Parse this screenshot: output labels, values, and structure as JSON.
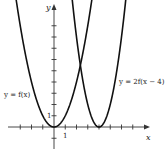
{
  "chart_data": {
    "type": "line",
    "title": "",
    "xlabel": "x",
    "ylabel": "y",
    "xlim": [
      -4,
      8
    ],
    "ylim": [
      -1,
      11
    ],
    "x_tick_step": 1,
    "y_tick_step": 1,
    "x_ticks": [
      -3,
      -2,
      -1,
      1,
      2,
      3,
      4,
      5,
      6,
      7
    ],
    "y_ticks": [
      -1,
      1,
      2,
      3,
      4,
      5,
      6,
      7,
      8,
      9
    ],
    "x_tick_labels": [
      {
        "value": 1,
        "text": "1"
      }
    ],
    "y_tick_labels": [
      {
        "value": 1,
        "text": "1"
      }
    ],
    "grid": false,
    "series": [
      {
        "name": "y = f(x)",
        "formula": "x^2",
        "vertex": [
          0,
          0
        ],
        "label": "y = f(x)",
        "label_side": "left"
      },
      {
        "name": "y = 2f(x − 4)",
        "formula": "2*(x-4)^2",
        "vertex": [
          4,
          0
        ],
        "label": "y = 2f(x − 4)",
        "label_side": "right"
      }
    ]
  }
}
